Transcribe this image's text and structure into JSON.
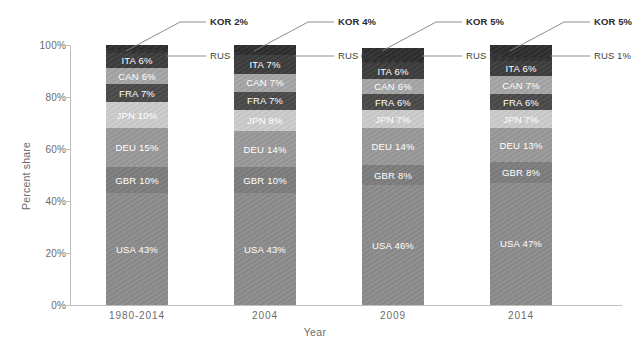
{
  "chart_data": {
    "type": "bar",
    "subtype": "stacked-percent",
    "title": "",
    "xlabel": "Year",
    "ylabel": "Percent share",
    "ylim": [
      0,
      100
    ],
    "ytick_labels": [
      "0%",
      "20%",
      "40%",
      "60%",
      "80%",
      "100%"
    ],
    "ytick_values": [
      0,
      20,
      40,
      60,
      80,
      100
    ],
    "grid": false,
    "legend": "none",
    "categories": [
      "1980-2014",
      "2004",
      "2009",
      "2014"
    ],
    "stack_order_bottom_to_top": [
      "USA",
      "GBR",
      "DEU",
      "JPN",
      "FRA",
      "CAN",
      "ITA",
      "RUS",
      "KOR"
    ],
    "series": [
      {
        "name": "USA",
        "values": [
          43,
          43,
          46,
          47
        ],
        "color": "#8c8c8c",
        "label_inside": true
      },
      {
        "name": "GBR",
        "values": [
          10,
          10,
          8,
          8
        ],
        "color": "#7d7d7d",
        "label_inside": true
      },
      {
        "name": "DEU",
        "values": [
          15,
          14,
          14,
          13
        ],
        "color": "#999999",
        "label_inside": true
      },
      {
        "name": "JPN",
        "values": [
          10,
          8,
          7,
          7
        ],
        "color": "#cccccc",
        "label_inside": true
      },
      {
        "name": "FRA",
        "values": [
          7,
          7,
          6,
          6
        ],
        "color": "#4a4a4a",
        "label_inside": true
      },
      {
        "name": "CAN",
        "values": [
          6,
          7,
          6,
          7
        ],
        "color": "#a6a6a6",
        "label_inside": true
      },
      {
        "name": "ITA",
        "values": [
          6,
          7,
          6,
          6
        ],
        "color": "#3d3d3d",
        "label_inside": true
      },
      {
        "name": "RUS",
        "values": [
          1,
          0,
          1,
          1
        ],
        "color": "#333333",
        "label_inside": false
      },
      {
        "name": "KOR",
        "values": [
          2,
          4,
          5,
          5
        ],
        "color": "#2e2e2e",
        "label_inside": false
      }
    ],
    "segment_labels": [
      [
        "USA 43%",
        "GBR 10%",
        "DEU 15%",
        "JPN 10%",
        "FRA 7%",
        "CAN 6%",
        "ITA 6%"
      ],
      [
        "USA 43%",
        "GBR 10%",
        "DEU 14%",
        "JPN 8%",
        "FRA 7%",
        "CAN 7%",
        "ITA 7%"
      ],
      [
        "USA 46%",
        "GBR 8%",
        "DEU 14%",
        "JPN 7%",
        "FRA 6%",
        "CAN 6%",
        "ITA 6%"
      ],
      [
        "USA 47%",
        "GBR 8%",
        "DEU 13%",
        "JPN 7%",
        "FRA 6%",
        "CAN 7%",
        "ITA 6%"
      ]
    ],
    "callouts": [
      {
        "bar": "1980-2014",
        "kor": "KOR 2%",
        "rus": "RUS 1%"
      },
      {
        "bar": "2004",
        "kor": "KOR 4%",
        "rus": "RUS 0%"
      },
      {
        "bar": "2009",
        "kor": "KOR 5%",
        "rus": "RUS 1%"
      },
      {
        "bar": "2014",
        "kor": "KOR 5%",
        "rus": "RUS 1%"
      }
    ],
    "colors": {
      "axis": "#bfbfbf",
      "tick_text": "#6b6b6b",
      "callout_text": "#3f3f3f",
      "segment_text": "#ffffff",
      "background": "#ffffff"
    }
  }
}
